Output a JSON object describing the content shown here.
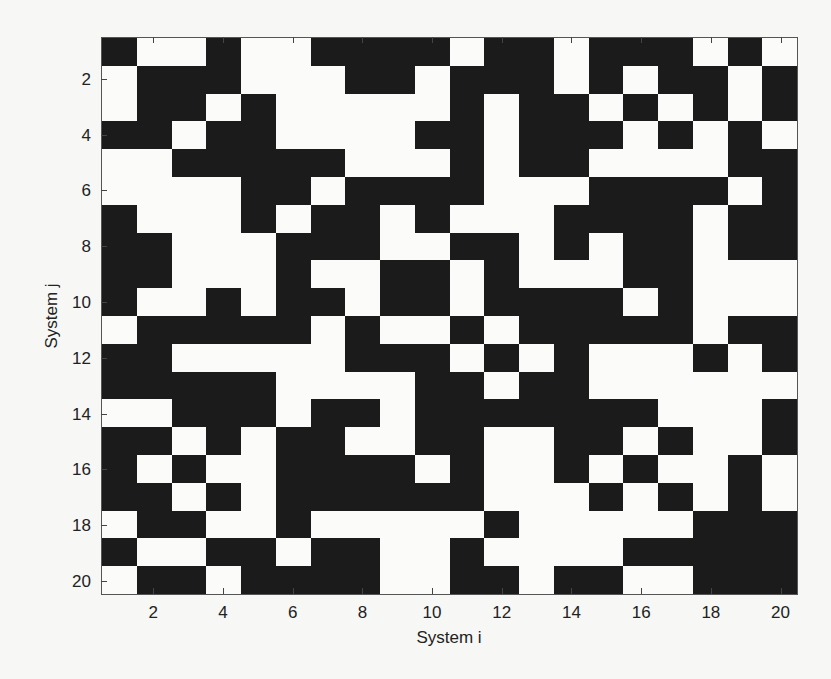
{
  "chart_data": {
    "type": "heatmap",
    "title": "",
    "xlabel": "System i",
    "ylabel": "System j",
    "x_ticks": [
      2,
      4,
      6,
      8,
      10,
      12,
      14,
      16,
      18,
      20
    ],
    "y_ticks": [
      2,
      4,
      6,
      8,
      10,
      12,
      14,
      16,
      18,
      20
    ],
    "x_range": [
      1,
      20
    ],
    "y_range": [
      1,
      20
    ],
    "y_axis_direction": "top-to-bottom",
    "colormap": {
      "1": "#1b1b1b",
      "0": "#fbfbf9"
    },
    "grid": false,
    "legend": null,
    "matrix": [
      [
        1,
        0,
        0,
        1,
        0,
        0,
        1,
        1,
        1,
        1,
        0,
        1,
        1,
        0,
        1,
        1,
        1,
        0,
        1,
        0
      ],
      [
        0,
        1,
        1,
        1,
        0,
        0,
        0,
        1,
        1,
        0,
        1,
        1,
        1,
        0,
        1,
        0,
        1,
        1,
        0,
        1
      ],
      [
        0,
        1,
        1,
        0,
        1,
        0,
        0,
        0,
        0,
        0,
        1,
        0,
        1,
        1,
        0,
        1,
        0,
        1,
        0,
        1
      ],
      [
        1,
        1,
        0,
        1,
        1,
        0,
        0,
        0,
        0,
        1,
        1,
        0,
        1,
        1,
        1,
        0,
        1,
        0,
        1,
        0
      ],
      [
        0,
        0,
        1,
        1,
        1,
        1,
        1,
        0,
        0,
        0,
        1,
        0,
        1,
        1,
        0,
        0,
        0,
        0,
        1,
        1
      ],
      [
        0,
        0,
        0,
        0,
        1,
        1,
        0,
        1,
        1,
        1,
        1,
        0,
        0,
        0,
        1,
        1,
        1,
        1,
        0,
        1
      ],
      [
        1,
        0,
        0,
        0,
        1,
        0,
        1,
        1,
        0,
        1,
        0,
        0,
        0,
        1,
        1,
        1,
        1,
        0,
        1,
        1
      ],
      [
        1,
        1,
        0,
        0,
        0,
        1,
        1,
        1,
        0,
        0,
        1,
        1,
        0,
        1,
        0,
        1,
        1,
        0,
        1,
        1
      ],
      [
        1,
        1,
        0,
        0,
        0,
        1,
        0,
        0,
        1,
        1,
        0,
        1,
        0,
        0,
        0,
        1,
        1,
        0,
        0,
        0
      ],
      [
        1,
        0,
        0,
        1,
        0,
        1,
        1,
        0,
        1,
        1,
        0,
        1,
        1,
        1,
        1,
        0,
        1,
        0,
        0,
        0
      ],
      [
        0,
        1,
        1,
        1,
        1,
        1,
        0,
        1,
        0,
        0,
        1,
        0,
        1,
        1,
        1,
        1,
        1,
        0,
        1,
        1
      ],
      [
        1,
        1,
        0,
        0,
        0,
        0,
        0,
        1,
        1,
        1,
        0,
        1,
        0,
        1,
        0,
        0,
        0,
        1,
        0,
        1
      ],
      [
        1,
        1,
        1,
        1,
        1,
        0,
        0,
        0,
        0,
        1,
        1,
        0,
        1,
        1,
        0,
        0,
        0,
        0,
        0,
        0
      ],
      [
        0,
        0,
        1,
        1,
        1,
        0,
        1,
        1,
        0,
        1,
        1,
        1,
        1,
        1,
        1,
        1,
        0,
        0,
        0,
        1
      ],
      [
        1,
        1,
        0,
        1,
        0,
        1,
        1,
        0,
        0,
        1,
        1,
        0,
        0,
        1,
        1,
        0,
        1,
        0,
        0,
        1
      ],
      [
        1,
        0,
        1,
        0,
        0,
        1,
        1,
        1,
        1,
        0,
        1,
        0,
        0,
        1,
        0,
        1,
        0,
        0,
        1,
        0
      ],
      [
        1,
        1,
        0,
        1,
        0,
        1,
        1,
        1,
        1,
        1,
        1,
        0,
        0,
        0,
        1,
        0,
        1,
        0,
        1,
        0
      ],
      [
        0,
        1,
        1,
        0,
        0,
        1,
        0,
        0,
        0,
        0,
        0,
        1,
        0,
        0,
        0,
        0,
        0,
        1,
        1,
        1
      ],
      [
        1,
        0,
        0,
        1,
        1,
        0,
        1,
        1,
        0,
        0,
        1,
        0,
        0,
        0,
        0,
        1,
        1,
        1,
        1,
        1
      ],
      [
        0,
        1,
        1,
        0,
        1,
        1,
        1,
        1,
        0,
        0,
        1,
        1,
        0,
        1,
        1,
        0,
        0,
        1,
        1,
        1
      ]
    ]
  },
  "axes": {
    "x_tick_labels": [
      "2",
      "4",
      "6",
      "8",
      "10",
      "12",
      "14",
      "16",
      "18",
      "20"
    ],
    "y_tick_labels": [
      "2",
      "4",
      "6",
      "8",
      "10",
      "12",
      "14",
      "16",
      "18",
      "20"
    ],
    "xlabel": "System i",
    "ylabel": "System j"
  }
}
